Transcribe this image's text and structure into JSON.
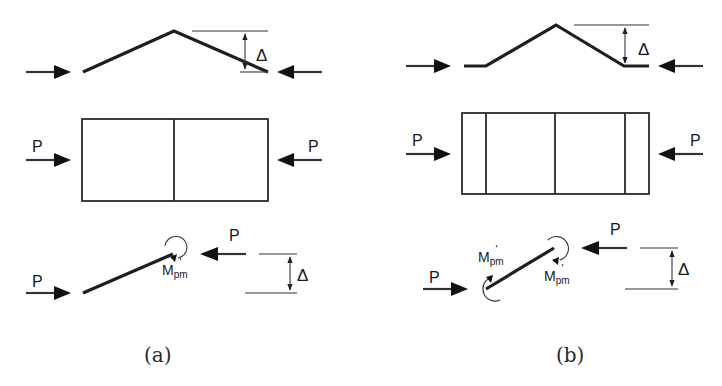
{
  "figure": {
    "panels": [
      {
        "id": "a",
        "caption": "(a)",
        "deflected_shape": {
          "delta_label": "Δ"
        },
        "plan_view": {
          "load_left_label": "P",
          "load_right_label": "P",
          "segments": 2
        },
        "free_body": {
          "load_left_label": "P",
          "load_right_label": "P",
          "moment_label_main": "M",
          "moment_label_sub": "pm",
          "moment_label_prime": "'",
          "delta_label": "Δ"
        }
      },
      {
        "id": "b",
        "caption": "(b)",
        "deflected_shape": {
          "delta_label": "Δ"
        },
        "plan_view": {
          "load_left_label": "P",
          "load_right_label": "P",
          "segments": 4
        },
        "free_body": {
          "load_left_label": "P",
          "load_right_label": "P",
          "moment_upper_label_main": "M",
          "moment_upper_label_sub": "pm",
          "moment_upper_label_prime": "'",
          "moment_lower_label_main": "M",
          "moment_lower_label_sub": "pm",
          "moment_lower_label_prime": "'",
          "delta_label": "Δ"
        }
      }
    ]
  },
  "colors": {
    "stroke": "#1e1e1e",
    "background": "#ffffff"
  }
}
